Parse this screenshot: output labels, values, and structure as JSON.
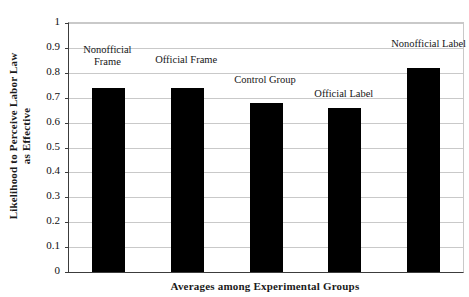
{
  "chart_data": {
    "type": "bar",
    "title": "",
    "xlabel": "Averages among Experimental Groups",
    "ylabel": "Likelihood to Perceive Labor Law as Effective",
    "ylabel_lines": [
      "Likelihood to Perceive Labor Law",
      "as Effective"
    ],
    "categories": [
      "Nonofficial Frame",
      "Official Frame",
      "Control Group",
      "Official Label",
      "Nonofficial Label"
    ],
    "category_lines": [
      [
        "Nonofficial",
        "Frame"
      ],
      [
        "Official Frame"
      ],
      [
        "Control Group"
      ],
      [
        "Official Label"
      ],
      [
        "Nonofficial Label"
      ]
    ],
    "values": [
      0.74,
      0.74,
      0.68,
      0.66,
      0.82
    ],
    "ylim": [
      0,
      1
    ],
    "ytick_values": [
      0,
      0.1,
      0.2,
      0.3,
      0.4,
      0.5,
      0.6,
      0.7,
      0.8,
      0.9,
      1
    ],
    "ytick_labels": [
      "0",
      "0.1",
      "0.2",
      "0.3",
      "0.4",
      "0.5",
      "0.6",
      "0.7",
      "0.8",
      "0.9",
      "1"
    ],
    "grid": true,
    "legend": "none",
    "bar_color": "#000000",
    "grid_color": "#c9c9c9",
    "axis_color": "#3c3c3c",
    "background": "#ffffff"
  }
}
